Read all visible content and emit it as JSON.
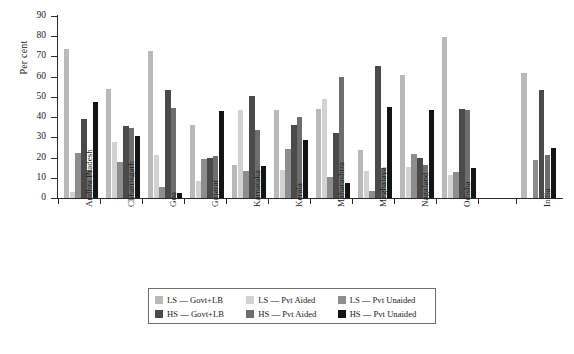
{
  "chart_data": {
    "type": "bar",
    "title": "",
    "subtitle": "",
    "xlabel": "",
    "ylabel": "Per cent",
    "ylim": [
      0,
      90
    ],
    "ytick_labels": [
      "0",
      "10",
      "20",
      "30",
      "40",
      "50",
      "60",
      "70",
      "80",
      "90"
    ],
    "ytick_values": [
      0,
      10,
      20,
      30,
      40,
      50,
      60,
      70,
      80,
      90
    ],
    "grid": false,
    "legend_position": "bottom-center",
    "categories": [
      "Andhra Pradesh",
      "Chhattisgarh",
      "Goa",
      "Gujarat",
      "Karnataka",
      "Kerala",
      "Maharashtra",
      "Meghalaya",
      "Nagaland",
      "Odisha",
      "India"
    ],
    "series": [
      {
        "name": "LS — Govt+LB",
        "color": "#b9b9b9",
        "values": [
          73.5,
          54.0,
          72.5,
          36.0,
          16.5,
          43.5,
          44.0,
          23.5,
          61.0,
          79.5,
          62.0
        ]
      },
      {
        "name": "LS — Pvt Aided",
        "color": "#d2d2d2",
        "values": [
          3.0,
          27.5,
          21.5,
          8.5,
          43.5,
          14.0,
          49.0,
          13.5,
          15.5,
          11.5,
          0.0
        ]
      },
      {
        "name": "LS — Pvt Unaided",
        "color": "#8d8d8d",
        "values": [
          22.5,
          18.0,
          5.5,
          19.5,
          13.5,
          24.0,
          10.5,
          3.5,
          22.0,
          13.0,
          19.0
        ]
      },
      {
        "name": "HS — Govt+LB",
        "color": "#4a4a4a",
        "values": [
          39.0,
          35.5,
          53.5,
          20.0,
          50.5,
          36.0,
          32.0,
          65.5,
          20.0,
          44.0,
          53.5
        ]
      },
      {
        "name": "HS — Pvt Aided",
        "color": "#6e6e6e",
        "values": [
          14.0,
          34.5,
          44.5,
          21.0,
          33.5,
          40.0,
          60.0,
          15.0,
          16.5,
          43.5,
          21.5
        ]
      },
      {
        "name": "HS — Pvt Unaided",
        "color": "#141414",
        "values": [
          47.5,
          30.5,
          2.5,
          43.0,
          16.0,
          28.5,
          7.5,
          45.0,
          43.5,
          15.0,
          24.5
        ]
      }
    ]
  },
  "legend": {
    "items": [
      {
        "label": "LS — Govt+LB",
        "color": "#b9b9b9"
      },
      {
        "label": "LS — Pvt Aided",
        "color": "#d2d2d2"
      },
      {
        "label": "LS — Pvt Unaided",
        "color": "#8d8d8d"
      },
      {
        "label": "HS — Govt+LB",
        "color": "#4a4a4a"
      },
      {
        "label": "HS — Pvt Aided",
        "color": "#6e6e6e"
      },
      {
        "label": "HS — Pvt Unaided",
        "color": "#141414"
      }
    ]
  }
}
